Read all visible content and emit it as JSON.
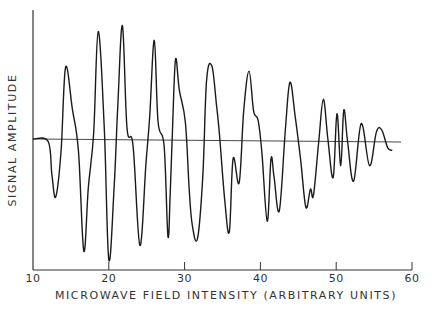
{
  "chart_data": {
    "type": "line",
    "title": "",
    "xlabel": "MICROWAVE FIELD INTENSITY (ARBITRARY UNITS)",
    "ylabel": "SIGNAL AMPLITUDE",
    "xlim": [
      10,
      60
    ],
    "x_ticks": [
      10,
      20,
      30,
      40,
      50,
      60
    ],
    "x_tick_labels": [
      "10",
      "20",
      "30",
      "40",
      "50",
      "60"
    ],
    "y_ticks": [],
    "grid": false,
    "legend": null,
    "baseline": 0,
    "series": [
      {
        "name": "signal",
        "x": [
          10,
          12.0,
          12.5,
          13.0,
          13.7,
          14.3,
          15.2,
          16.0,
          16.7,
          17.3,
          18.0,
          18.6,
          19.4,
          20.0,
          20.7,
          21.2,
          21.8,
          22.4,
          23.2,
          24.1,
          24.9,
          25.4,
          26.0,
          26.5,
          27.3,
          27.8,
          28.1,
          28.4,
          28.8,
          29.3,
          30.1,
          30.6,
          31.0,
          31.7,
          32.4,
          32.9,
          33.6,
          34.2,
          34.6,
          35.3,
          35.9,
          36.4,
          37.2,
          37.8,
          38.5,
          39.1,
          39.7,
          40.2,
          40.9,
          41.4,
          41.8,
          42.5,
          43.3,
          43.9,
          44.6,
          45.3,
          46.0,
          46.6,
          47.0,
          47.7,
          48.3,
          48.9,
          49.6,
          50.1,
          50.6,
          51.0,
          51.5,
          52.3,
          53.3,
          54.4,
          55.3,
          56.0,
          56.8,
          57.4
        ],
        "y": [
          0,
          -0.02,
          -0.3,
          -0.48,
          -0.1,
          0.6,
          0.25,
          -0.1,
          -0.93,
          -0.4,
          0.05,
          0.9,
          0.1,
          -1.0,
          -0.4,
          0.3,
          0.95,
          0.1,
          -0.05,
          -0.88,
          -0.2,
          0.2,
          0.83,
          0.15,
          -0.05,
          -0.8,
          -0.45,
          0.08,
          0.67,
          0.42,
          0.15,
          -0.4,
          -0.7,
          -0.82,
          -0.3,
          0.5,
          0.62,
          0.3,
          0.05,
          -0.5,
          -0.76,
          -0.15,
          -0.35,
          0.25,
          0.58,
          0.25,
          0.17,
          -0.1,
          -0.67,
          -0.15,
          -0.3,
          -0.58,
          0.1,
          0.49,
          0.2,
          -0.15,
          -0.55,
          -0.4,
          -0.45,
          0.0,
          0.35,
          0.02,
          -0.3,
          0.23,
          -0.2,
          0.26,
          0.0,
          -0.33,
          0.15,
          -0.2,
          0.08,
          0.1,
          -0.05,
          -0.07
        ]
      }
    ]
  },
  "colors": {
    "line": "#1a1a1a",
    "axis": "#333333",
    "background": "#ffffff"
  }
}
